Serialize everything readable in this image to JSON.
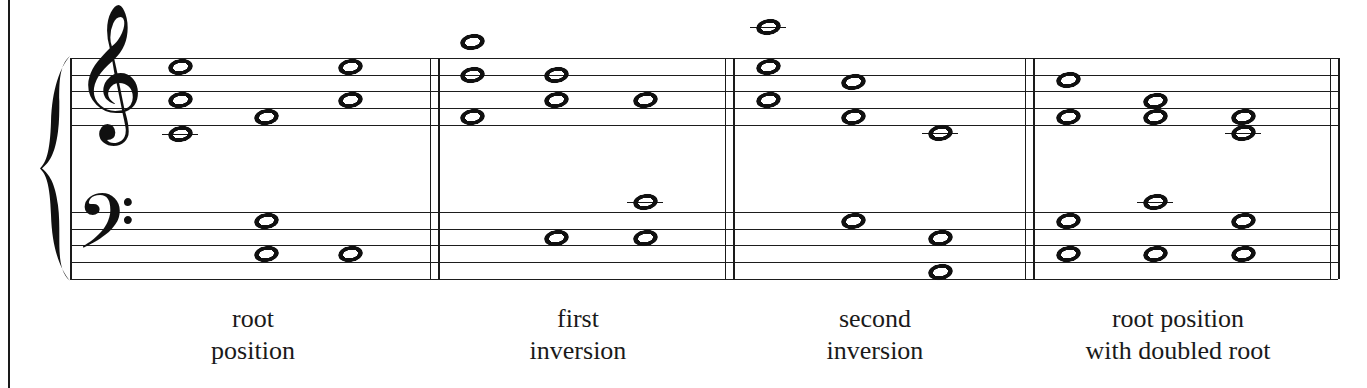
{
  "figure": {
    "kind": "music-notation",
    "page_border_color": "#1a1a1a",
    "ink_color": "#101010"
  },
  "score": {
    "clefs": {
      "treble_glyph": "𝄞",
      "bass_glyph": "𝄢",
      "brace_glyph": "{"
    },
    "staff": {
      "left": 70,
      "right": 1338,
      "treble_top_line_y": 58,
      "bass_top_line_y": 212,
      "line_spacing": 16.7,
      "line_count": 5
    },
    "barlines": [
      {
        "name": "measure-1-end",
        "x": 430,
        "double": true
      },
      {
        "name": "measure-2-end",
        "x": 725,
        "double": true
      },
      {
        "name": "measure-3-end",
        "x": 1025,
        "double": true
      },
      {
        "name": "score-end",
        "x": 1330,
        "double": true
      }
    ],
    "measures": [
      {
        "id": "measure-1",
        "label_lines": [
          "root",
          "position"
        ],
        "label_center_x": 253,
        "notes": [
          {
            "staff": "treble",
            "x": 180,
            "y": 67,
            "ledger": false
          },
          {
            "staff": "treble",
            "x": 180,
            "y": 100,
            "ledger": false
          },
          {
            "staff": "treble",
            "x": 180,
            "y": 134,
            "ledger": true
          },
          {
            "staff": "treble",
            "x": 266,
            "y": 117,
            "ledger": false
          },
          {
            "staff": "treble",
            "x": 350,
            "y": 67,
            "ledger": false
          },
          {
            "staff": "treble",
            "x": 350,
            "y": 100,
            "ledger": false
          },
          {
            "staff": "bass",
            "x": 266,
            "y": 221,
            "ledger": false
          },
          {
            "staff": "bass",
            "x": 266,
            "y": 254,
            "ledger": false
          },
          {
            "staff": "bass",
            "x": 350,
            "y": 254,
            "ledger": false
          }
        ]
      },
      {
        "id": "measure-2",
        "label_lines": [
          "first",
          "inversion"
        ],
        "label_center_x": 578,
        "notes": [
          {
            "staff": "treble",
            "x": 472,
            "y": 42,
            "ledger": false
          },
          {
            "staff": "treble",
            "x": 472,
            "y": 75,
            "ledger": false
          },
          {
            "staff": "treble",
            "x": 472,
            "y": 117,
            "ledger": false
          },
          {
            "staff": "treble",
            "x": 556,
            "y": 75,
            "ledger": false
          },
          {
            "staff": "treble",
            "x": 556,
            "y": 100,
            "ledger": false
          },
          {
            "staff": "treble",
            "x": 645,
            "y": 100,
            "ledger": false
          },
          {
            "staff": "treble",
            "x": 645,
            "y": 202,
            "ledger": true
          },
          {
            "staff": "bass",
            "x": 556,
            "y": 238,
            "ledger": false
          },
          {
            "staff": "bass",
            "x": 645,
            "y": 238,
            "ledger": false
          }
        ]
      },
      {
        "id": "measure-3",
        "label_lines": [
          "second",
          "inversion"
        ],
        "label_center_x": 875,
        "notes": [
          {
            "staff": "treble",
            "x": 768,
            "y": 27,
            "ledger": true
          },
          {
            "staff": "treble",
            "x": 768,
            "y": 67,
            "ledger": false
          },
          {
            "staff": "treble",
            "x": 768,
            "y": 100,
            "ledger": false
          },
          {
            "staff": "treble",
            "x": 853,
            "y": 82,
            "ledger": false
          },
          {
            "staff": "treble",
            "x": 853,
            "y": 117,
            "ledger": false
          },
          {
            "staff": "treble",
            "x": 940,
            "y": 133,
            "ledger": true
          },
          {
            "staff": "bass",
            "x": 853,
            "y": 221,
            "ledger": false
          },
          {
            "staff": "bass",
            "x": 940,
            "y": 238,
            "ledger": false
          },
          {
            "staff": "bass",
            "x": 940,
            "y": 272,
            "ledger": false
          }
        ]
      },
      {
        "id": "measure-4",
        "label_lines": [
          "root position",
          "with doubled root"
        ],
        "label_center_x": 1178,
        "notes": [
          {
            "staff": "treble",
            "x": 1068,
            "y": 80,
            "ledger": false
          },
          {
            "staff": "treble",
            "x": 1068,
            "y": 117,
            "ledger": false
          },
          {
            "staff": "treble",
            "x": 1155,
            "y": 101,
            "ledger": false
          },
          {
            "staff": "treble",
            "x": 1155,
            "y": 117,
            "ledger": false
          },
          {
            "staff": "treble",
            "x": 1155,
            "y": 202,
            "ledger": true
          },
          {
            "staff": "treble",
            "x": 1243,
            "y": 117,
            "ledger": false
          },
          {
            "staff": "treble",
            "x": 1243,
            "y": 133,
            "ledger": true
          },
          {
            "staff": "bass",
            "x": 1068,
            "y": 221,
            "ledger": false
          },
          {
            "staff": "bass",
            "x": 1068,
            "y": 254,
            "ledger": false
          },
          {
            "staff": "bass",
            "x": 1155,
            "y": 254,
            "ledger": false
          },
          {
            "staff": "bass",
            "x": 1243,
            "y": 221,
            "ledger": false
          },
          {
            "staff": "bass",
            "x": 1243,
            "y": 254,
            "ledger": false
          }
        ]
      }
    ]
  },
  "captions": {
    "y": 303,
    "items": [
      {
        "name": "caption-root-position",
        "lines": [
          "root",
          "position"
        ],
        "center_x": 253
      },
      {
        "name": "caption-first-inversion",
        "lines": [
          "first",
          "inversion"
        ],
        "center_x": 578
      },
      {
        "name": "caption-second-inversion",
        "lines": [
          "second",
          "inversion"
        ],
        "center_x": 875
      },
      {
        "name": "caption-root-doubled",
        "lines": [
          "root position",
          "with doubled root"
        ],
        "center_x": 1178
      }
    ]
  }
}
